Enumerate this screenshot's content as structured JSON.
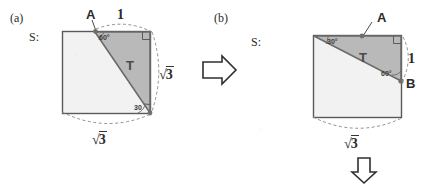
{
  "figure": {
    "colors": {
      "square_fill": "#f2f2f2",
      "triangle_fill": "#b8b8b8",
      "stroke": "#555555",
      "dashed_stroke": "#8a8a8a",
      "text": "#2b2b2b",
      "background": "#ffffff"
    }
  },
  "panel_a": {
    "tag": "(a)",
    "set_label": "S:",
    "triangle_label": "T",
    "vertex_label": "A",
    "angle_at_a": "60°",
    "angle_at_bottom": "30",
    "top_length": "1",
    "right_length": "√3",
    "bottom_length": "√3",
    "sqrt_radical": "√",
    "sqrt_number": "3"
  },
  "panel_b": {
    "tag": "(b)",
    "set_label": "S:",
    "triangle_label": "T",
    "vertex_label_a": "A",
    "vertex_label_b": "B",
    "angle_at_topleft": "30°",
    "angle_at_b": "60°",
    "right_length": "1",
    "bottom_length": "√3",
    "sqrt_radical": "√",
    "sqrt_number": "3"
  },
  "arrows": {
    "right_arrow": "⇒",
    "down_arrow": "⇓"
  }
}
